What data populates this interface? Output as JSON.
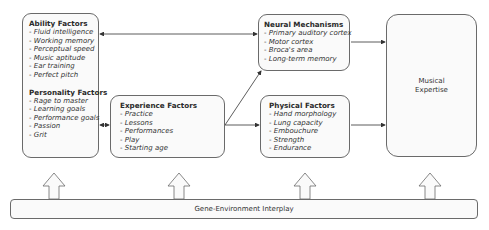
{
  "diagram": {
    "ability": {
      "title": "Ability Factors",
      "items": [
        "Fluid intelligence",
        "Working memory",
        "Perceptual speed",
        "Music aptitude",
        "Ear training",
        "Perfect pitch"
      ]
    },
    "personality": {
      "title": "Personality Factors",
      "items": [
        "Rage to master",
        "Learning goals",
        "Performance goals",
        "Passion",
        "Grit"
      ]
    },
    "experience": {
      "title": "Experience Factors",
      "items": [
        "Practice",
        "Lessons",
        "Performances",
        "Play",
        "Starting age"
      ]
    },
    "neural": {
      "title": "Neural Mechanisms",
      "items": [
        "Primary auditory cortex",
        "Motor cortex",
        "Broca's area",
        "Long-term memory"
      ]
    },
    "physical": {
      "title": "Physical Factors",
      "items": [
        "Hand morphology",
        "Lung capacity",
        "Embouchure",
        "Strength",
        "Endurance"
      ]
    },
    "outcome": {
      "line1": "Musical",
      "line2": "Expertise"
    },
    "foundation": {
      "label": "Gene-Environment Interplay"
    },
    "colors": {
      "stroke": "#6a6a6a",
      "fill": "#fafafa",
      "arrow": "#333333"
    }
  }
}
